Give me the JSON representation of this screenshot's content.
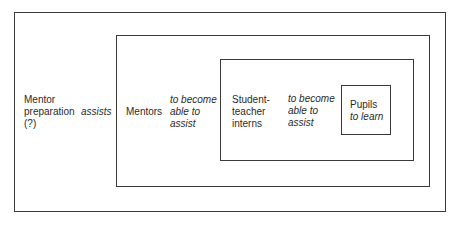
{
  "diagram": {
    "type": "nested-boxes",
    "colors": {
      "background": "#ffffff",
      "stroke": "#3a3a3a",
      "text": "#2a2a2a"
    },
    "boxes": [
      {
        "id": "mentor-preparation",
        "level": 1,
        "subject": [
          "Mentor",
          "preparation",
          "(?)"
        ],
        "action": [
          "assists"
        ]
      },
      {
        "id": "mentors",
        "level": 2,
        "subject": [
          "Mentors"
        ],
        "action": [
          "to become",
          "able to",
          "assist"
        ]
      },
      {
        "id": "student-teacher-interns",
        "level": 3,
        "subject": [
          "Student-",
          "teacher",
          "interns"
        ],
        "action": [
          "to become",
          "able to",
          "assist"
        ]
      },
      {
        "id": "pupils",
        "level": 4,
        "subject": [
          "Pupils"
        ],
        "action": [
          "to learn"
        ]
      }
    ]
  }
}
